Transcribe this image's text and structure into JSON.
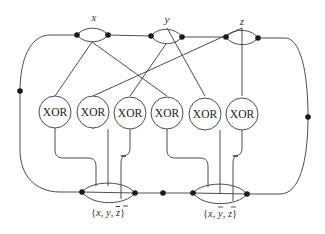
{
  "diagram": {
    "type": "circuit-gadget",
    "variables": [
      {
        "id": "x",
        "label": "x"
      },
      {
        "id": "y",
        "label": "y"
      },
      {
        "id": "z",
        "label": "z"
      }
    ],
    "gates": [
      {
        "label": "XOR"
      },
      {
        "label": "XOR"
      },
      {
        "label": "XOR"
      },
      {
        "label": "XOR"
      },
      {
        "label": "XOR"
      },
      {
        "label": "XOR"
      }
    ],
    "clauses": [
      {
        "open": "{",
        "a": "x",
        "sep1": ", ",
        "b": "y",
        "sep2": ", ",
        "c": "z",
        "close": "}",
        "negated": [
          "z"
        ]
      },
      {
        "open": "{",
        "a": "x",
        "sep1": ", ",
        "b": "y",
        "sep2": ", ",
        "c": "z",
        "close": "}",
        "negated": [
          "y",
          "z"
        ]
      }
    ],
    "colors": {
      "line": "#3a3a3a",
      "node": "#1a1a1a",
      "background": "#ffffff"
    }
  }
}
